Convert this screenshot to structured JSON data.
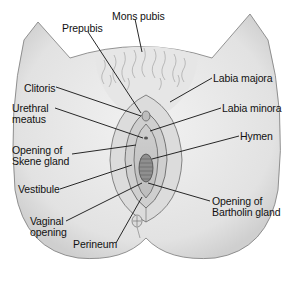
{
  "figure": {
    "type": "anatomical-diagram"
  },
  "labels": [
    {
      "id": "mons-pubis",
      "text": "Mons pubis",
      "x": 112,
      "y": 11
    },
    {
      "id": "prepubis",
      "text": "Prepubis",
      "x": 62,
      "y": 23
    },
    {
      "id": "labia-majora",
      "text": "Labia majora",
      "x": 213,
      "y": 73
    },
    {
      "id": "clitoris",
      "text": "Clitoris",
      "x": 24,
      "y": 83
    },
    {
      "id": "urethral-meatus",
      "text": "Urethral\nmeatus",
      "x": 12,
      "y": 103
    },
    {
      "id": "labia-minora",
      "text": "Labia minora",
      "x": 222,
      "y": 103
    },
    {
      "id": "hymen",
      "text": "Hymen",
      "x": 240,
      "y": 131
    },
    {
      "id": "skene-gland-opening",
      "text": "Opening of\nSkene gland",
      "x": 12,
      "y": 145
    },
    {
      "id": "vestibule",
      "text": "Vestibule",
      "x": 18,
      "y": 184
    },
    {
      "id": "bartholin-gland-opening",
      "text": "Opening of\nBartholin gland",
      "x": 212,
      "y": 196
    },
    {
      "id": "vaginal-opening",
      "text": "Vaginal\nopening",
      "x": 30,
      "y": 216
    },
    {
      "id": "perineum",
      "text": "Perineum",
      "x": 73,
      "y": 239
    }
  ],
  "colors": {
    "skin_fill": "#ececec",
    "skin_shade": "#d4d4d4",
    "outline": "#555555",
    "leader_line": "#111111",
    "text": "#111111"
  }
}
